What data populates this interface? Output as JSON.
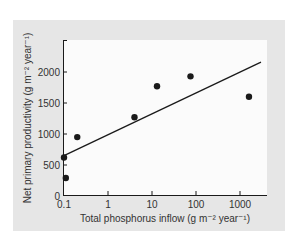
{
  "chart_data": {
    "type": "scatter",
    "title": "",
    "xlabel": "Total phosphorus inflow (g m⁻² year⁻¹)",
    "ylabel": "Net primary productivity (g m⁻² year⁻¹)",
    "xscale": "log",
    "xlim": [
      0.1,
      3000
    ],
    "ylim": [
      0,
      2500
    ],
    "x_ticks": [
      0.1,
      1,
      10,
      100,
      1000
    ],
    "x_tick_labels": [
      "0.1",
      "1",
      "10",
      "100",
      "1000"
    ],
    "y_ticks": [
      0,
      500,
      1000,
      1500,
      2000
    ],
    "y_tick_labels": [
      "0",
      "500",
      "1000",
      "1500",
      "2000"
    ],
    "grid": false,
    "legend": null,
    "series": [
      {
        "name": "observations",
        "marker": "filled-circle",
        "points": [
          {
            "x": 0.1,
            "y": 620
          },
          {
            "x": 0.11,
            "y": 290
          },
          {
            "x": 0.2,
            "y": 950
          },
          {
            "x": 4,
            "y": 1270
          },
          {
            "x": 13,
            "y": 1770
          },
          {
            "x": 75,
            "y": 1930
          },
          {
            "x": 1600,
            "y": 1600
          }
        ]
      },
      {
        "name": "regression line",
        "style": "line",
        "points": [
          {
            "x": 0.1,
            "y": 650
          },
          {
            "x": 3000,
            "y": 2160
          }
        ]
      }
    ],
    "colors": {
      "panel_bg": "#e6e6e6",
      "plot_bg": "#fbfbfb",
      "ink": "#1a1a1a"
    }
  }
}
